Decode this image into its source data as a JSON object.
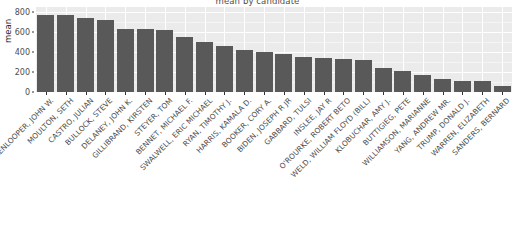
{
  "chart_data": {
    "type": "bar",
    "title": "mean by candidate",
    "xlabel": "",
    "ylabel": "mean",
    "ylim": [
      0,
      800
    ],
    "y_ticks": [
      0,
      200,
      400,
      600,
      800
    ],
    "grid": true,
    "legend": "none",
    "bar_color": "#595959",
    "panel_color": "#ebebeb",
    "gridline_color": "#ffffff",
    "categories": [
      "HICKENLOOPER, JOHN W.",
      "MOULTON, SETH",
      "CASTRO, JULIAN",
      "BULLOCK, STEVE",
      "DELANEY, JOHN K.",
      "GILLIBRAND, KIRSTEN",
      "STEYER, TOM",
      "BENNET, MICHAEL F.",
      "SWALWELL, ERIC MICHAEL",
      "RYAN, TIMOTHY J.",
      "HARRIS, KAMALA D.",
      "BOOKER, CORY A.",
      "BIDEN, JOSEPH R JR",
      "GABBARD, TULSI",
      "INSLEE, JAY R",
      "O'ROURKE, ROBERT BETO",
      "WELD, WILLIAM FLOYD (BILL)",
      "KLOBUCHAR, AMY J.",
      "BUTTIGIEG, PETE",
      "WILLIAMSON, MARIANNE",
      "YANG, ANDREW MR.",
      "TRUMP, DONALD J.",
      "WARREN, ELIZABETH",
      "SANDERS, BERNARD"
    ],
    "values": [
      775,
      768,
      740,
      725,
      630,
      628,
      620,
      553,
      505,
      463,
      425,
      400,
      385,
      355,
      340,
      330,
      325,
      240,
      215,
      175,
      135,
      115,
      110,
      60
    ]
  }
}
